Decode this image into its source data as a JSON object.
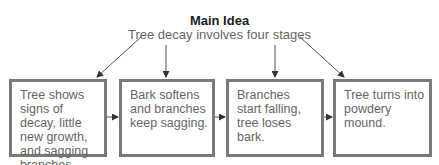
{
  "main_idea": {
    "title": "Main Idea",
    "subtitle": "Tree decay involves four stages"
  },
  "stages": [
    {
      "text": "Tree shows signs of decay, little new growth, and sagging branches."
    },
    {
      "text": "Bark softens and branches keep sagging."
    },
    {
      "text": "Branches start falling, tree loses bark."
    },
    {
      "text": "Tree turns into powdery mound."
    }
  ],
  "colors": {
    "box_border": "#7a7a7a",
    "text": "#666666",
    "line": "#444444"
  }
}
